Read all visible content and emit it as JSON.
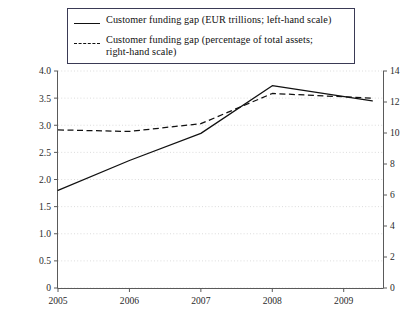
{
  "legend": {
    "entries": [
      {
        "key": "solid-line",
        "label": "Customer funding gap (EUR trillions; left-hand scale)"
      },
      {
        "key": "dashed-line",
        "label": "Customer funding gap (percentage of total assets; right-hand scale)"
      }
    ],
    "line1_label": "Customer funding gap (EUR trillions; left-hand scale)",
    "line2_label_part1": "Customer funding gap (percentage of total assets;",
    "line2_label_part2": "right-hand scale)"
  },
  "axes": {
    "left_ticks": [
      "4.0",
      "3.5",
      "3.0",
      "2.5",
      "2.0",
      "1.5",
      "1.0",
      "0.5",
      "0"
    ],
    "right_ticks": [
      "14",
      "12",
      "10",
      "8",
      "6",
      "4",
      "2",
      "0"
    ],
    "x_ticks": [
      "2005",
      "2006",
      "2007",
      "2008",
      "2009"
    ]
  },
  "colors": {
    "line": "#111111",
    "grid": "#d8d8d8",
    "axis": "#5a5a5a",
    "legend_border": "#3a3a55",
    "background": "#ffffff"
  },
  "chart_data": {
    "type": "line",
    "title": "",
    "xlabel": "",
    "ylabel": "EUR trillions",
    "y2label": "percentage of total assets",
    "categories": [
      "2005",
      "2006",
      "2007",
      "2008",
      "2009"
    ],
    "x": [
      2005,
      2006,
      2007,
      2008,
      2009
    ],
    "ylim": [
      0,
      4.0
    ],
    "y2lim": [
      0,
      14
    ],
    "yticks": [
      0,
      0.5,
      1.0,
      1.5,
      2.0,
      2.5,
      3.0,
      3.5,
      4.0
    ],
    "y2ticks": [
      0,
      2,
      4,
      6,
      8,
      10,
      12,
      14
    ],
    "grid": true,
    "legend_position": "top",
    "series": [
      {
        "name": "Customer funding gap (EUR trillions; left-hand scale)",
        "axis": "left",
        "style": "solid",
        "x": [
          2005,
          2006,
          2007,
          2008,
          2009.4
        ],
        "values": [
          1.8,
          2.35,
          2.85,
          3.73,
          3.45
        ]
      },
      {
        "name": "Customer funding gap (percentage of total assets; right-hand scale)",
        "axis": "right",
        "style": "dashed",
        "x": [
          2005,
          2006,
          2007,
          2008,
          2009.4
        ],
        "values": [
          10.2,
          10.1,
          10.6,
          12.55,
          12.25
        ]
      }
    ]
  }
}
